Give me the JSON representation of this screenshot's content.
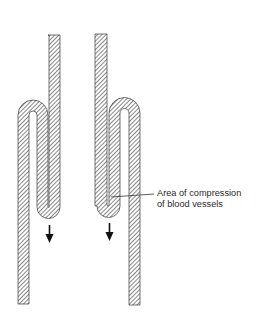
{
  "figure": {
    "annotation": {
      "line1": "Area of compression",
      "line2": "of blood vessels"
    },
    "elements": {
      "left_fold": "folded-vessel",
      "right_fold": "folded-vessel",
      "left_arrow": "down-arrow-icon",
      "right_arrow": "down-arrow-icon"
    },
    "colors": {
      "outline": "#3a3a3a",
      "hatch": "#555555",
      "background": "#ffffff"
    }
  }
}
